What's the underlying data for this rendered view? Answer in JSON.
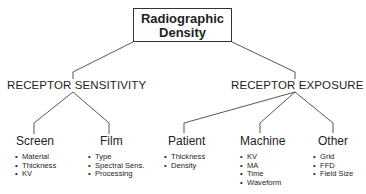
{
  "root": {
    "line1": "Radiographic",
    "line2": "Density"
  },
  "categories": [
    {
      "label": "RECEPTOR SENSITIVITY",
      "children": [
        {
          "label": "Screen",
          "items": [
            "Material",
            "Thickness",
            "KV"
          ]
        },
        {
          "label": "Film",
          "items": [
            "Type",
            "Spectral Sens.",
            "Processing"
          ]
        }
      ]
    },
    {
      "label": "RECEPTOR EXPOSURE",
      "children": [
        {
          "label": "Patient",
          "items": [
            "Thickness",
            "Density"
          ]
        },
        {
          "label": "Machine",
          "items": [
            "KV",
            "MA",
            "Time",
            "Waveform"
          ]
        },
        {
          "label": "Other",
          "items": [
            "Grid",
            "FFD",
            "Field Size"
          ]
        }
      ]
    }
  ]
}
